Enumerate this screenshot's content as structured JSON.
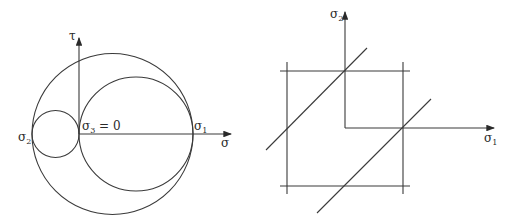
{
  "mohr_diagram": {
    "axes": {
      "tau_label": "τ",
      "sigma_label": "σ"
    },
    "points": {
      "sigma2": {
        "base": "σ",
        "sub": "2"
      },
      "sigma3": {
        "base": "σ",
        "sub": "3",
        "suffix": " = 0"
      },
      "sigma1": {
        "base": "σ",
        "sub": "1"
      }
    },
    "circles": [
      "outer (σ2–σ1)",
      "large (σ3–σ1)",
      "small (σ2–σ3)"
    ]
  },
  "yield_diagram": {
    "axes": {
      "y_label": {
        "base": "σ",
        "sub": "2"
      },
      "x_label": {
        "base": "σ",
        "sub": "1"
      }
    },
    "shapes": [
      "square",
      "two 45° diagonal lines",
      "first-quadrant corner"
    ]
  },
  "colors": {
    "line": "#3a3a3a",
    "background": "#ffffff"
  }
}
